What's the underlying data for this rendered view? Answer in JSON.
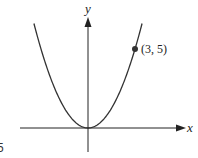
{
  "chart_data": {
    "type": "line",
    "title": "",
    "xlabel": "x",
    "ylabel": "y",
    "function": "y = (5/9) x^2",
    "series": [
      {
        "name": "parabola",
        "x": [
          -3.5,
          -3,
          -2,
          -1,
          0,
          1,
          2,
          3,
          3.5
        ],
        "values": [
          6.81,
          5,
          2.22,
          0.56,
          0,
          0.56,
          2.22,
          5,
          6.81
        ]
      }
    ],
    "annotations": [
      {
        "label": "(3, 5)",
        "x": 3,
        "y": 5,
        "marker": "filled-dot"
      }
    ],
    "grid": false,
    "legend": null
  },
  "labels": {
    "x_axis": "x",
    "y_axis": "y",
    "point": "(3, 5)",
    "corner_fragment": "5"
  },
  "colors": {
    "curve": "#333333",
    "axes": "#222222",
    "background": "#ffffff"
  }
}
